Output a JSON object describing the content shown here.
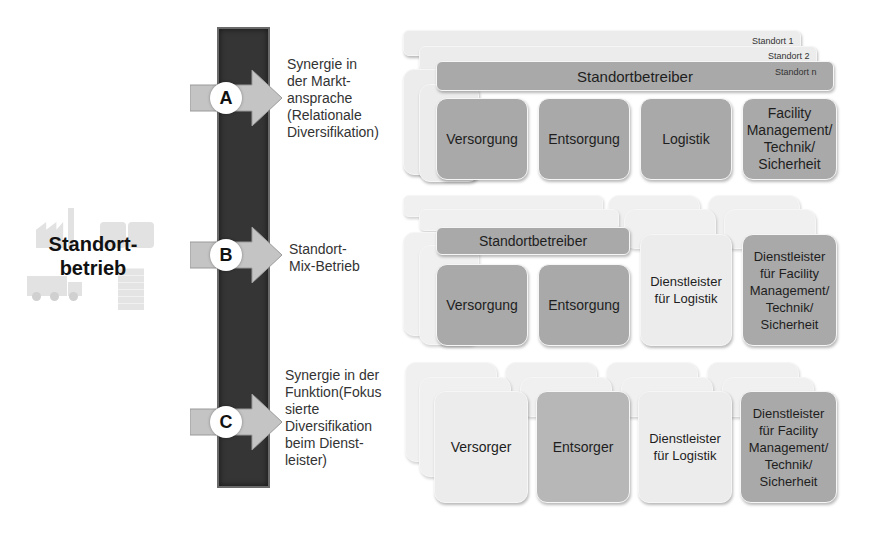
{
  "main": {
    "title_line1": "Standort-",
    "title_line2": "betrieb"
  },
  "options": [
    {
      "letter": "A",
      "description": [
        "Synergie in",
        "der Markt-",
        "ansprache",
        "(Relationale",
        "Diversifikation)"
      ]
    },
    {
      "letter": "B",
      "description": [
        "Standort-",
        "Mix-Betrieb"
      ]
    },
    {
      "letter": "C",
      "description": [
        "Synergie in der",
        "Funktion(Fokus",
        "sierte",
        "Diversifikation",
        "beim Dienst-",
        "leister)"
      ]
    }
  ],
  "row_a": {
    "sites": [
      "Standort 1",
      "Standort 2",
      "Standort n"
    ],
    "operator": "Standortbetreiber",
    "functions": [
      "Versorgung",
      "Entsorgung",
      "Logistik",
      "Facility\nManagement/\nTechnik/\nSicherheit"
    ]
  },
  "row_b": {
    "operator": "Standortbetreiber",
    "functions": [
      "Versorgung",
      "Entsorgung",
      "Dienstleister\nfür Logistik",
      "Dienstleister\nfür Facility\nManagement/\nTechnik/\nSicherheit"
    ]
  },
  "row_c": {
    "functions": [
      "Versorger",
      "Entsorger",
      "Dienstleister\nfür Logistik",
      "Dienstleister\nfür Facility\nManagement/\nTechnik/\nSicherheit"
    ]
  },
  "colors": {
    "bar": "#353535",
    "box_dark": "#a9a9a9",
    "box_light": "#ececec",
    "arrow": "#c4c4c4"
  }
}
